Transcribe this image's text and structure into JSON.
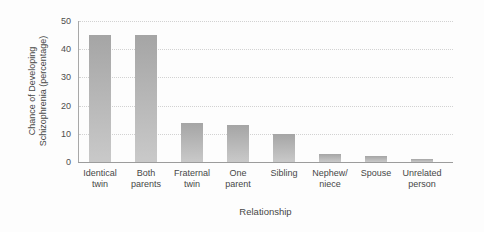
{
  "chart_data": {
    "type": "bar",
    "title": "",
    "xlabel": "Relationship",
    "ylabel": "Chance of Developing Schizophrenia (percentage)",
    "ylabel_lines": [
      "Chance of Developing",
      "Schizophrenia (percentage)"
    ],
    "categories": [
      "Identical twin",
      "Both parents",
      "Fraternal twin",
      "One parent",
      "Sibling",
      "Nephew/niece",
      "Spouse",
      "Unrelated person"
    ],
    "category_label_lines": [
      [
        "Identical",
        "twin"
      ],
      [
        "Both",
        "parents"
      ],
      [
        "Fraternal",
        "twin"
      ],
      [
        "One",
        "parent"
      ],
      [
        "Sibling"
      ],
      [
        "Nephew/",
        "niece"
      ],
      [
        "Spouse"
      ],
      [
        "Unrelated",
        "person"
      ]
    ],
    "values": [
      45,
      45,
      14,
      13,
      10,
      3,
      2,
      1
    ],
    "ylim": [
      0,
      50
    ],
    "yticks": [
      0,
      10,
      20,
      30,
      40,
      50
    ],
    "grid": "horizontal-dotted",
    "legend": "none",
    "colors": {
      "bar_top": "#a5a5a5",
      "bar_bottom": "#c9c9c9",
      "gridline": "#d2d2d2",
      "axis_line": "#9c9c9c",
      "text": "#474747"
    }
  }
}
